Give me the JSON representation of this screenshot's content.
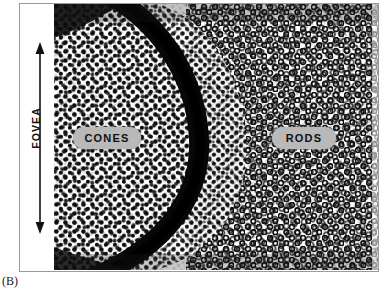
{
  "figure": {
    "panel_caption": "(B)",
    "frame_border_color": "#9a9a9a",
    "background_color": "#ffffff"
  },
  "axis": {
    "label": "FOVEA",
    "orientation": "vertical",
    "arrow_style": "double-headed",
    "arrow_color": "#111111"
  },
  "callouts": [
    {
      "id": "cones",
      "label": "CONES",
      "pill_color": "#b9b9b9",
      "text_color": "#111111",
      "region": "left"
    },
    {
      "id": "rods",
      "label": "RODS",
      "pill_color": "#b9b9b9",
      "text_color": "#111111",
      "region": "right"
    }
  ],
  "regions": {
    "cones_region": {
      "name": "cones-mosaic",
      "cell_appearance": "solid-dark-dots",
      "cell_color": "#101010",
      "background": "#ffffff"
    },
    "rods_region": {
      "name": "rods-mosaic",
      "cell_appearance": "dark-rings-white-centers",
      "cell_color": "#101010",
      "background": "#ffffff"
    },
    "boundary_arc": {
      "name": "fovea-rim-dense-band",
      "color": "#0a0a0a",
      "description": "dense dark curved band separating cone-rich fovea from rod-rich periphery"
    }
  }
}
